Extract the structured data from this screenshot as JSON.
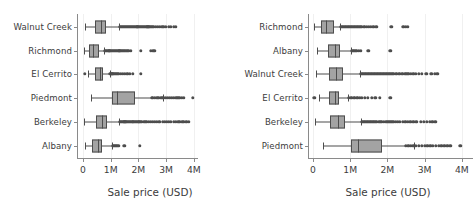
{
  "chart_data": [
    {
      "type": "box",
      "panel": "left",
      "title": "",
      "xlabel": "Sale price (USD)",
      "ylabel": "",
      "xlim": [
        0,
        4150000
      ],
      "xticks": [
        0,
        1000000,
        2000000,
        3000000,
        4000000
      ],
      "xticklabels": [
        "0",
        "1M",
        "2M",
        "3M",
        "4M"
      ],
      "grid": true,
      "legend": "none",
      "categories": [
        "Walnut Creek",
        "Richmond",
        "El Cerrito",
        "Piedmont",
        "Berkeley",
        "Albany"
      ],
      "boxes": [
        {
          "category": "Walnut Creek",
          "whisker_low": 72000,
          "q1": 435000,
          "median": 650000,
          "q3": 830000,
          "whisker_high": 1290000,
          "fliers": [
            1320000,
            1360000,
            1400000,
            1440000,
            1470000,
            1500000,
            1540000,
            1580000,
            1610000,
            1650000,
            1690000,
            1730000,
            1770000,
            1800000,
            1840000,
            1880000,
            1920000,
            1960000,
            2000000,
            2040000,
            2080000,
            2120000,
            2160000,
            2200000,
            2240000,
            2280000,
            2320000,
            2360000,
            2400000,
            2440000,
            2480000,
            2520000,
            2560000,
            2620000,
            2700000,
            2780000,
            2850000,
            2900000,
            3000000,
            3100000,
            3180000,
            3280000,
            3350000
          ]
        },
        {
          "category": "Richmond",
          "whisker_low": 25000,
          "q1": 230000,
          "median": 360000,
          "q3": 565000,
          "whisker_high": 760000,
          "fliers": [
            790000,
            830000,
            870000,
            910000,
            950000,
            990000,
            1030000,
            1070000,
            1110000,
            1150000,
            1190000,
            1230000,
            1270000,
            1310000,
            1350000,
            1390000,
            1430000,
            1470000,
            1510000,
            1560000,
            1610000,
            1660000,
            1720000,
            2090000,
            2450000,
            2530000,
            2580000
          ]
        },
        {
          "category": "El Cerrito",
          "whisker_low": 180000,
          "q1": 440000,
          "median": 600000,
          "q3": 720000,
          "whisker_high": 960000,
          "fliers": [
            55000,
            980000,
            1020000,
            1060000,
            1100000,
            1140000,
            1180000,
            1220000,
            1260000,
            1300000,
            1360000,
            1430000,
            1510000,
            1600000,
            1700000,
            1800000,
            2090000
          ]
        },
        {
          "category": "Piedmont",
          "whisker_low": 300000,
          "q1": 1050000,
          "median": 1230000,
          "q3": 1870000,
          "whisker_high": 2900000,
          "fliers": [
            2480000,
            2530000,
            2600000,
            2660000,
            2720000,
            2800000,
            2860000,
            2920000,
            2990000,
            3060000,
            3130000,
            3200000,
            3270000,
            3340000,
            3410000,
            3480000,
            3560000,
            3630000,
            3960000
          ]
        },
        {
          "category": "Berkeley",
          "whisker_low": 40000,
          "q1": 480000,
          "median": 690000,
          "q3": 870000,
          "whisker_high": 1290000,
          "fliers": [
            1320000,
            1370000,
            1410000,
            1450000,
            1490000,
            1530000,
            1570000,
            1610000,
            1650000,
            1690000,
            1730000,
            1780000,
            1820000,
            1860000,
            1900000,
            1950000,
            1990000,
            2030000,
            2080000,
            2130000,
            2190000,
            2250000,
            2310000,
            2380000,
            2440000,
            2520000,
            2590000,
            2670000,
            2750000,
            2880000,
            2960000,
            3030000,
            3100000,
            3180000,
            3280000,
            3360000,
            3440000,
            3500000,
            3580000,
            3650000,
            3730000,
            3810000
          ]
        },
        {
          "category": "Albany",
          "whisker_low": 90000,
          "q1": 340000,
          "median": 540000,
          "q3": 700000,
          "whisker_high": 1040000,
          "fliers": [
            1070000,
            1110000,
            1150000,
            1190000,
            1230000,
            1270000,
            1490000,
            2060000
          ]
        }
      ]
    },
    {
      "type": "box",
      "panel": "right",
      "title": "",
      "xlabel": "Sale price (USD)",
      "ylabel": "",
      "xlim": [
        0,
        4300000
      ],
      "xticks": [
        0,
        1000000,
        2000000,
        3000000,
        4000000
      ],
      "xticklabels": [
        "0",
        "1M",
        "2M",
        "3M",
        "4M"
      ],
      "grid": true,
      "legend": "none",
      "categories": [
        "Richmond",
        "Albany",
        "Walnut Creek",
        "El Cerrito",
        "Berkeley",
        "Piedmont"
      ],
      "boxes": [
        {
          "category": "Richmond",
          "whisker_low": 20000,
          "q1": 220000,
          "median": 360000,
          "q3": 560000,
          "whisker_high": 730000,
          "fliers": [
            760000,
            800000,
            840000,
            880000,
            920000,
            960000,
            1000000,
            1040000,
            1080000,
            1120000,
            1160000,
            1200000,
            1240000,
            1280000,
            1320000,
            1360000,
            1400000,
            1450000,
            1500000,
            1560000,
            1620000,
            1700000,
            2110000,
            2430000,
            2500000,
            2550000
          ]
        },
        {
          "category": "Albany",
          "whisker_low": 110000,
          "q1": 400000,
          "median": 580000,
          "q3": 720000,
          "whisker_high": 1030000,
          "fliers": [
            1060000,
            1100000,
            1140000,
            1180000,
            1230000,
            1280000,
            1490000,
            2080000
          ]
        },
        {
          "category": "Walnut Creek",
          "whisker_low": 80000,
          "q1": 430000,
          "median": 620000,
          "q3": 810000,
          "whisker_high": 1270000,
          "fliers": [
            1300000,
            1340000,
            1380000,
            1420000,
            1460000,
            1500000,
            1540000,
            1580000,
            1620000,
            1660000,
            1700000,
            1740000,
            1780000,
            1820000,
            1860000,
            1900000,
            1940000,
            1980000,
            2020000,
            2060000,
            2100000,
            2140000,
            2180000,
            2220000,
            2260000,
            2300000,
            2340000,
            2380000,
            2420000,
            2460000,
            2500000,
            2540000,
            2580000,
            2630000,
            2700000,
            2770000,
            2850000,
            2920000,
            3050000,
            3180000,
            3270000,
            3340000
          ]
        },
        {
          "category": "El Cerrito",
          "whisker_low": 170000,
          "q1": 430000,
          "median": 590000,
          "q3": 710000,
          "whisker_high": 950000,
          "fliers": [
            40000,
            970000,
            1010000,
            1050000,
            1090000,
            1130000,
            1170000,
            1210000,
            1260000,
            1320000,
            1400000,
            1480000,
            1580000,
            1680000,
            1800000,
            2080000
          ]
        },
        {
          "category": "Berkeley",
          "whisker_low": 50000,
          "q1": 470000,
          "median": 680000,
          "q3": 860000,
          "whisker_high": 1280000,
          "fliers": [
            1310000,
            1350000,
            1390000,
            1430000,
            1470000,
            1510000,
            1550000,
            1590000,
            1640000,
            1680000,
            1720000,
            1770000,
            1810000,
            1850000,
            1900000,
            1950000,
            2000000,
            2050000,
            2100000,
            2160000,
            2220000,
            2280000,
            2340000,
            2410000,
            2480000,
            2550000,
            2620000,
            2700000,
            2780000,
            2900000,
            2980000,
            3060000,
            3140000,
            3210000,
            3290000
          ]
        },
        {
          "category": "Piedmont",
          "whisker_low": 280000,
          "q1": 1030000,
          "median": 1220000,
          "q3": 1860000,
          "whisker_high": 2720000,
          "fliers": [
            2500000,
            2560000,
            2630000,
            2700000,
            2770000,
            2850000,
            2920000,
            3000000,
            3070000,
            3150000,
            3220000,
            3300000,
            3380000,
            3450000,
            3530000,
            3610000,
            3690000,
            3960000
          ]
        }
      ]
    }
  ],
  "style": {
    "box_fill": "#a3a3a3",
    "box_edge": "#4d4d4d",
    "grid_color": "#f0f0f0",
    "axis_color": "#8a8a8a",
    "text_color": "#3c3c3c",
    "background": "#ffffff"
  }
}
